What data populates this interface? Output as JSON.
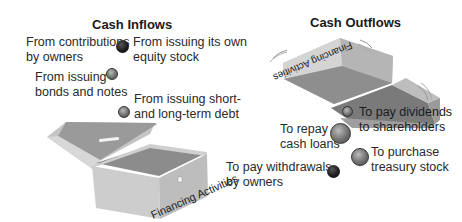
{
  "inflows": {
    "title": "Cash Inflows",
    "items": [
      {
        "label_line1": "From contributions",
        "label_line2": "by owners"
      },
      {
        "label_line1": "From issuing its own",
        "label_line2": "equity stock"
      },
      {
        "label_line1": "From issuing",
        "label_line2": "bonds and notes"
      },
      {
        "label_line1": "From issuing short-",
        "label_line2": "and long-term debt"
      }
    ],
    "box_label": "Financing Activities"
  },
  "outflows": {
    "title": "Cash Outflows",
    "items": [
      {
        "label_line1": "To pay dividends",
        "label_line2": "to shareholders"
      },
      {
        "label_line1": "To repay",
        "label_line2": "cash loans"
      },
      {
        "label_line1": "To purchase",
        "label_line2": "treasury stock"
      },
      {
        "label_line1": "To pay withdrawals",
        "label_line2": "by owners"
      }
    ],
    "box_label": "Financing Activities"
  },
  "colors": {
    "box_light": "#d6d6d6",
    "box_mid": "#b5b5b5",
    "box_dark": "#8e8e8e",
    "text": "#2a2a2a"
  }
}
